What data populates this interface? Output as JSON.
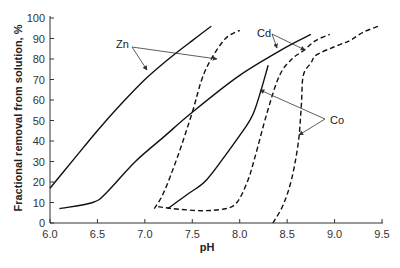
{
  "chart_data": {
    "type": "line",
    "title": "",
    "xlabel": "pH",
    "ylabel": "Fractional removal from solution, %",
    "xlim": [
      6.0,
      9.5
    ],
    "ylim": [
      0,
      100
    ],
    "grid": false,
    "legend": "none (curves labeled directly with arrow annotations)",
    "x_ticks": [
      "6.0",
      "6.5",
      "7.0",
      "7.5",
      "8.0",
      "8.5",
      "9.0",
      "9.5"
    ],
    "x_tick_values": [
      6.0,
      6.5,
      7.0,
      7.5,
      8.0,
      8.5,
      9.0,
      9.5
    ],
    "y_ticks": [
      "0",
      "10",
      "20",
      "30",
      "40",
      "50",
      "60",
      "70",
      "80",
      "90",
      "100"
    ],
    "y_tick_values": [
      0,
      10,
      20,
      30,
      40,
      50,
      60,
      70,
      80,
      90,
      100
    ],
    "series": [
      {
        "name": "Zn (solid)",
        "metal": "Zn",
        "style": "solid",
        "points": [
          [
            6.0,
            17
          ],
          [
            6.25,
            31
          ],
          [
            6.5,
            45
          ],
          [
            6.75,
            58
          ],
          [
            7.0,
            70
          ],
          [
            7.25,
            80
          ],
          [
            7.5,
            89
          ],
          [
            7.7,
            96
          ]
        ]
      },
      {
        "name": "Zn (dashed)",
        "metal": "Zn",
        "style": "dashed",
        "points": [
          [
            7.1,
            7
          ],
          [
            7.2,
            15
          ],
          [
            7.35,
            33
          ],
          [
            7.5,
            54
          ],
          [
            7.6,
            70
          ],
          [
            7.7,
            80
          ],
          [
            7.85,
            90
          ],
          [
            8.0,
            94
          ]
        ]
      },
      {
        "name": "Cd (solid)",
        "metal": "Cd",
        "style": "solid",
        "points": [
          [
            6.1,
            7
          ],
          [
            6.45,
            10
          ],
          [
            6.6,
            15
          ],
          [
            6.9,
            30
          ],
          [
            7.2,
            42
          ],
          [
            7.5,
            54
          ],
          [
            8.0,
            72
          ],
          [
            8.5,
            86
          ],
          [
            8.75,
            92
          ]
        ]
      },
      {
        "name": "Cd (dashed)",
        "metal": "Cd",
        "style": "dashed",
        "points": [
          [
            7.14,
            8
          ],
          [
            7.3,
            7
          ],
          [
            7.6,
            6
          ],
          [
            7.85,
            7
          ],
          [
            7.97,
            10
          ],
          [
            8.08,
            20
          ],
          [
            8.16,
            32
          ],
          [
            8.29,
            54
          ],
          [
            8.42,
            72
          ],
          [
            8.55,
            80
          ],
          [
            8.67,
            84
          ],
          [
            8.8,
            89
          ],
          [
            8.95,
            92
          ]
        ]
      },
      {
        "name": "Co (solid)",
        "metal": "Co",
        "style": "solid",
        "points": [
          [
            7.24,
            7
          ],
          [
            7.45,
            14
          ],
          [
            7.65,
            21
          ],
          [
            7.88,
            35
          ],
          [
            8.05,
            46
          ],
          [
            8.14,
            53
          ],
          [
            8.22,
            64
          ],
          [
            8.3,
            77
          ]
        ]
      },
      {
        "name": "Co (dashed)",
        "metal": "Co",
        "style": "dashed",
        "points": [
          [
            8.35,
            0
          ],
          [
            8.46,
            9
          ],
          [
            8.55,
            22
          ],
          [
            8.62,
            40
          ],
          [
            8.65,
            58
          ],
          [
            8.67,
            72
          ],
          [
            8.75,
            78
          ],
          [
            8.81,
            82
          ],
          [
            9.0,
            86
          ],
          [
            9.16,
            89
          ],
          [
            9.3,
            93
          ],
          [
            9.46,
            96
          ]
        ]
      }
    ],
    "annotations": [
      {
        "text": "Zn",
        "label_pos": [
          116,
          48
        ],
        "origin": [
          132,
          47
        ],
        "arrow_tips": [
          [
            147,
            70
          ],
          [
            217,
            59
          ]
        ]
      },
      {
        "text": "Cd",
        "label_pos": [
          257,
          37
        ],
        "origin": [
          272,
          34
        ],
        "arrow_tips": [
          [
            277,
            48
          ],
          [
            305,
            50
          ]
        ]
      },
      {
        "text": "Co",
        "label_pos": [
          330,
          124
        ],
        "origin": [
          325,
          119
        ],
        "arrow_tips": [
          [
            260,
            90
          ],
          [
            299,
            135
          ]
        ]
      }
    ]
  }
}
